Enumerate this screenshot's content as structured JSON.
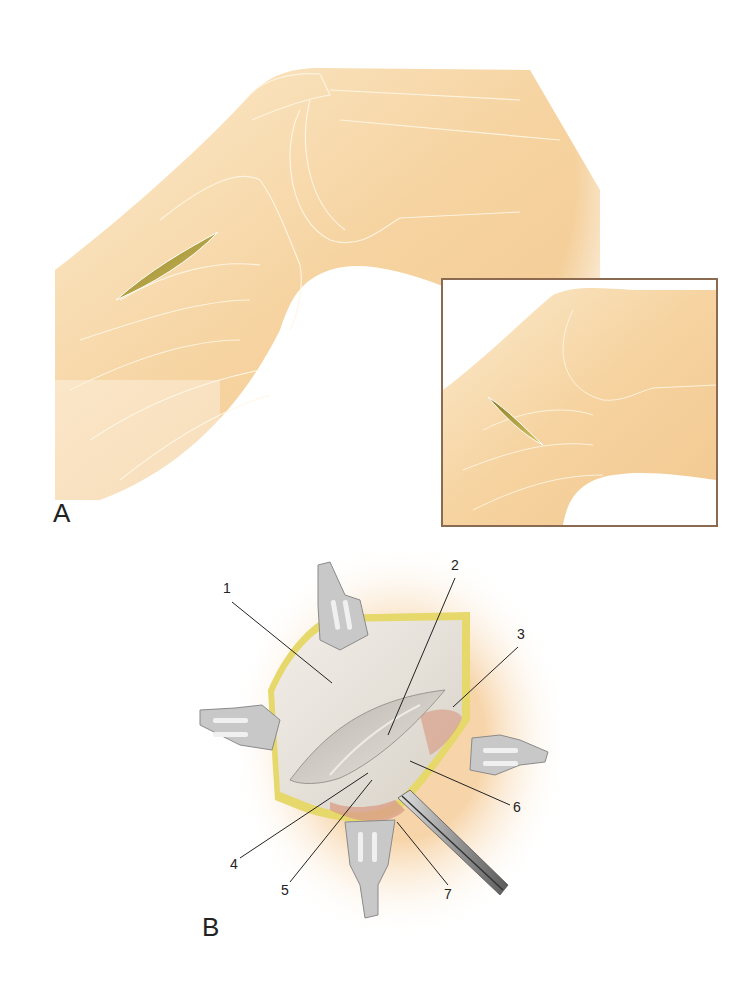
{
  "figure": {
    "panels": [
      {
        "id": "A",
        "label": "A",
        "description": "Flexed knee lateral view with oblique skin incision over the distal thigh; inset shows a closer view of the incision"
      },
      {
        "id": "B",
        "label": "B",
        "description": "Surgical exposure through the incision held open by four retractors, with a forceps instrument; numbered callouts 1–7"
      }
    ],
    "callouts": [
      {
        "number": "1"
      },
      {
        "number": "2"
      },
      {
        "number": "3"
      },
      {
        "number": "4"
      },
      {
        "number": "5"
      },
      {
        "number": "6"
      },
      {
        "number": "7"
      }
    ],
    "colors": {
      "skin": "#f6d6a6",
      "skin_light": "#fbe8c8",
      "incision": "#b8a040",
      "inset_border": "#8a6a50",
      "fascia": "#e8e2d8",
      "fat_edge": "#e6d86a",
      "retractor": "#c8c8c8",
      "leader_line": "#222222",
      "tissue_pink": "#d9a08a"
    }
  }
}
